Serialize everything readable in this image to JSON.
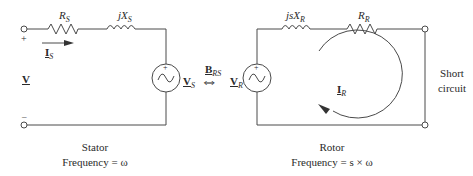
{
  "stator": {
    "resistor": {
      "symbol": "R",
      "sub": "S"
    },
    "reactance": {
      "symbol": "jX",
      "sub": "S"
    },
    "current": {
      "symbol": "I",
      "sub": "S"
    },
    "terminal_voltage": {
      "symbol": "V"
    },
    "plus": "+",
    "minus": "–",
    "source_voltage": {
      "symbol": "V",
      "sub": "S"
    },
    "caption_title": "Stator",
    "caption_freq": "Frequency = ω"
  },
  "coupling": {
    "symbol": "B",
    "sub": "RS",
    "arrow": "⇔"
  },
  "rotor": {
    "source_voltage": {
      "symbol": "V",
      "sub": "R"
    },
    "reactance": {
      "symbol": "jsX",
      "sub": "R"
    },
    "resistor": {
      "symbol": "R",
      "sub": "R"
    },
    "current": {
      "symbol": "I",
      "sub": "R"
    },
    "short_line1": "Short",
    "short_line2": "circuit",
    "caption_title": "Rotor",
    "caption_freq": "Frequency = s × ω"
  },
  "colors": {
    "line": "#4a4a4a",
    "text": "#2a2a2a"
  }
}
